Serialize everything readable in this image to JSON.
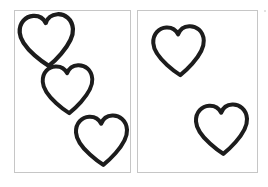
{
  "canvas": {
    "width": 268,
    "height": 187,
    "background_color": "#ffffff"
  },
  "figure": {
    "panel_border_color": "#c6c6c6",
    "panel_fill_color": "#ffffff",
    "heart_outline_color": "#1c1c1c",
    "heart_fill_color": "#ffffff",
    "total_heart_count": 5
  },
  "panels": [
    {
      "name": "left-panel",
      "position": {
        "x": 14,
        "y": 10,
        "width": 117,
        "height": 163
      },
      "heart_count": 3,
      "hearts": [
        {
          "name": "heart-top-left",
          "x": 16,
          "y": 12,
          "width": 62,
          "height": 57,
          "rotation": -4
        },
        {
          "name": "heart-middle",
          "x": 39,
          "y": 63,
          "width": 58,
          "height": 53,
          "rotation": -3
        },
        {
          "name": "heart-bottom-right",
          "x": 73,
          "y": 113,
          "width": 58,
          "height": 55,
          "rotation": -3
        }
      ]
    },
    {
      "name": "right-panel",
      "position": {
        "x": 137,
        "y": 10,
        "width": 121,
        "height": 163
      },
      "heart_count": 2,
      "hearts": [
        {
          "name": "heart-upper-left",
          "x": 150,
          "y": 24,
          "width": 58,
          "height": 54,
          "rotation": -3
        },
        {
          "name": "heart-lower-right",
          "x": 193,
          "y": 102,
          "width": 58,
          "height": 55,
          "rotation": -3
        }
      ]
    }
  ],
  "artifacts": [
    {
      "name": "edge-speck",
      "x": 264,
      "y": 10,
      "size": 2
    }
  ]
}
